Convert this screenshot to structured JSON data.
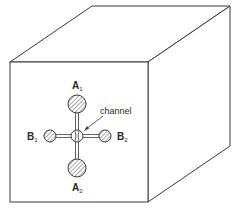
{
  "diagram": {
    "type": "cube-with-electrode-cross",
    "colors": {
      "line": "#3a3a3a",
      "background": "#ffffff",
      "hatch": "#555555"
    },
    "labels": {
      "a1": {
        "main": "A",
        "sub": "1"
      },
      "a2": {
        "main": "A",
        "sub": "2"
      },
      "b1": {
        "main": "B",
        "sub": "1"
      },
      "b2": {
        "main": "B",
        "sub": "2"
      },
      "channel": "channel"
    }
  }
}
